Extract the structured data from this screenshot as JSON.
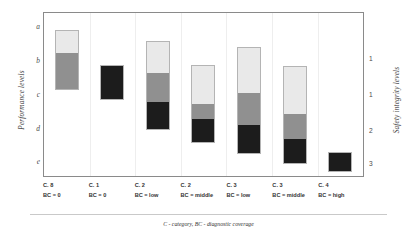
{
  "chart_data": {
    "type": "bar",
    "title": "",
    "subtitle": "",
    "xlabel": "",
    "ylabel": "Performance levels",
    "y2label": "Safety integrity levels",
    "ylim": [
      "a",
      "e"
    ],
    "grid": "vertical-faint",
    "legend": "none",
    "orientation": "vertical",
    "bar_style": "stacked-range",
    "y_ticks": [
      "a",
      "b",
      "c",
      "d",
      "e"
    ],
    "y2_ticks": [
      "1",
      "1",
      "2",
      "3"
    ],
    "categories": [
      "C. 8\nBC = 0",
      "C. 1\nBC = 0",
      "C. 2\nBC = low",
      "C. 2\nBC = middle",
      "C. 3\nBC = low",
      "C. 3\nBC = middle",
      "C. 4\nBC = high"
    ],
    "segment_names": [
      "light",
      "medium",
      "dark"
    ],
    "segment_colors": [
      "#e9e9e9",
      "#909090",
      "#1c1c1c"
    ],
    "series": [
      {
        "name": "light",
        "values": [
          1.0,
          0,
          1.3,
          1.6,
          1.9,
          2.0,
          0
        ]
      },
      {
        "name": "medium",
        "values": [
          1.4,
          0,
          1.2,
          0.6,
          1.1,
          1.3,
          0
        ]
      },
      {
        "name": "dark",
        "values": [
          0,
          1.4,
          1.1,
          1.0,
          1.2,
          1.0,
          0.7
        ]
      }
    ],
    "annotations": [],
    "footnote": "C - category, BC - diagnostic coverage"
  },
  "axes": {
    "left": {
      "title": "Performance levels",
      "ticks": [
        {
          "label": "a",
          "top": 26
        },
        {
          "label": "b",
          "top": 60
        },
        {
          "label": "c",
          "top": 94
        },
        {
          "label": "d",
          "top": 128
        },
        {
          "label": "e",
          "top": 161
        }
      ]
    },
    "right": {
      "title": "Safety integrity levels",
      "ticks": [
        {
          "label": "1",
          "top": 59
        },
        {
          "label": "1",
          "top": 95
        },
        {
          "label": "2",
          "top": 131
        },
        {
          "label": "3",
          "top": 164
        }
      ]
    }
  },
  "bars": [
    {
      "id": "bar-c8-bc0",
      "cat_line1": "C. 8",
      "cat_line2": "BC = 0",
      "center_pct": 7.15,
      "top": 17,
      "height": 60,
      "segments": [
        {
          "name": "light",
          "color": "#e9e9e9",
          "height": 23
        },
        {
          "name": "medium",
          "color": "#909090",
          "height": 37
        }
      ]
    },
    {
      "id": "bar-c1-bc0",
      "cat_line1": "C. 1",
      "cat_line2": "BC = 0",
      "center_pct": 21.4,
      "top": 52,
      "height": 35,
      "segments": [
        {
          "name": "dark",
          "color": "#1c1c1c",
          "height": 35
        }
      ]
    },
    {
      "id": "bar-c2-bclow",
      "cat_line1": "C. 2",
      "cat_line2": "BC = low",
      "center_pct": 35.7,
      "top": 28,
      "height": 89,
      "segments": [
        {
          "name": "light",
          "color": "#e9e9e9",
          "height": 32
        },
        {
          "name": "medium",
          "color": "#909090",
          "height": 29
        },
        {
          "name": "dark",
          "color": "#1c1c1c",
          "height": 28
        }
      ]
    },
    {
      "id": "bar-c2-bcmiddle",
      "cat_line1": "C. 2",
      "cat_line2": "BC = middle",
      "center_pct": 50.0,
      "top": 52,
      "height": 78,
      "segments": [
        {
          "name": "light",
          "color": "#e9e9e9",
          "height": 39
        },
        {
          "name": "medium",
          "color": "#909090",
          "height": 15
        },
        {
          "name": "dark",
          "color": "#1c1c1c",
          "height": 24
        }
      ]
    },
    {
      "id": "bar-c3-bclow",
      "cat_line1": "C. 3",
      "cat_line2": "BC = low",
      "center_pct": 64.3,
      "top": 34,
      "height": 107,
      "segments": [
        {
          "name": "light",
          "color": "#e9e9e9",
          "height": 46
        },
        {
          "name": "medium",
          "color": "#909090",
          "height": 32
        },
        {
          "name": "dark",
          "color": "#1c1c1c",
          "height": 29
        }
      ]
    },
    {
      "id": "bar-c3-bcmiddle",
      "cat_line1": "C. 3",
      "cat_line2": "BC = middle",
      "center_pct": 78.6,
      "top": 53,
      "height": 98,
      "segments": [
        {
          "name": "light",
          "color": "#e9e9e9",
          "height": 48
        },
        {
          "name": "medium",
          "color": "#909090",
          "height": 26
        },
        {
          "name": "dark",
          "color": "#1c1c1c",
          "height": 24
        }
      ]
    },
    {
      "id": "bar-c4-bchigh",
      "cat_line1": "C. 4",
      "cat_line2": "BC = high",
      "center_pct": 92.9,
      "top": 139,
      "height": 20,
      "segments": [
        {
          "name": "dark",
          "color": "#1c1c1c",
          "height": 20
        }
      ]
    }
  ],
  "gridlines": [
    14.3,
    28.6,
    42.9,
    57.2,
    71.5,
    85.8
  ],
  "footnote": {
    "prefix_bold": "C",
    "text": "C - category, BC - diagnostic coverage"
  }
}
